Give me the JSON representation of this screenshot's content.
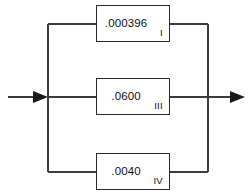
{
  "diagram": {
    "type": "parallel-block-diagram",
    "orientation": "horizontal",
    "background_color": "#ffffff",
    "line_color": "#3c3c3c",
    "box_border_color": "#2b2b2b",
    "text_color": "#111111",
    "input": {
      "label": "",
      "arrow": "arrow-right"
    },
    "output": {
      "label": "",
      "arrow": "arrow-right"
    },
    "blocks": [
      {
        "id": "block-1",
        "value": ".000396",
        "numeral": "I",
        "branch": "top"
      },
      {
        "id": "block-3",
        "value": ".0600",
        "numeral": "III",
        "branch": "middle"
      },
      {
        "id": "block-4",
        "value": ".0040",
        "numeral": "IV",
        "branch": "bottom"
      }
    ]
  }
}
